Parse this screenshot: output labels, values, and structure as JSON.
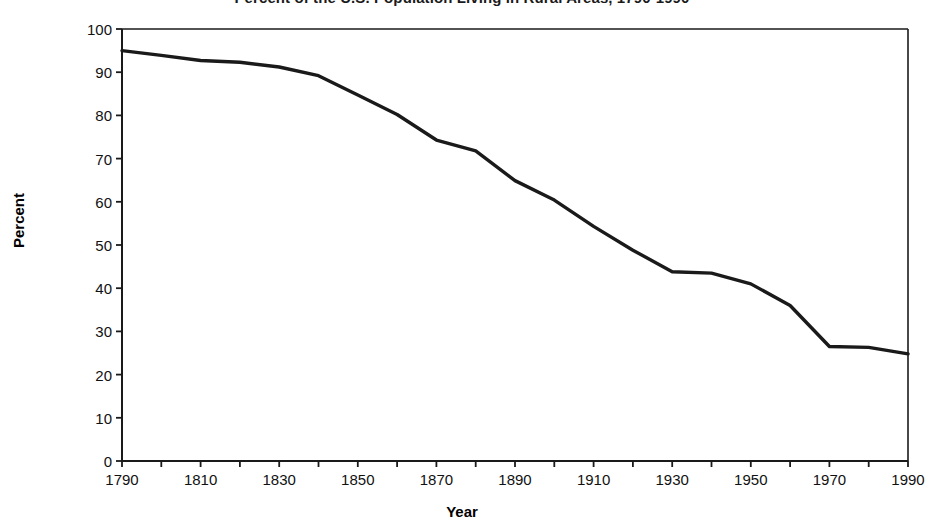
{
  "chart_data": {
    "type": "line",
    "title": "Percent of the U.S. Population Living in Rural Areas, 1790-1990",
    "xlabel": "Year",
    "ylabel": "Percent",
    "xlim": [
      1790,
      1990
    ],
    "ylim": [
      0,
      100
    ],
    "grid": false,
    "legend": null,
    "x_ticks": [
      "1790",
      "1810",
      "1830",
      "1850",
      "1870",
      "1890",
      "1910",
      "1930",
      "1950",
      "1970",
      "1990"
    ],
    "y_ticks": [
      "0",
      "10",
      "20",
      "30",
      "40",
      "50",
      "60",
      "70",
      "80",
      "90",
      "100"
    ],
    "series": [
      {
        "name": "Rural population",
        "color": "#1a1a1a",
        "x": [
          1790,
          1800,
          1810,
          1820,
          1830,
          1840,
          1850,
          1860,
          1870,
          1880,
          1890,
          1900,
          1910,
          1920,
          1930,
          1940,
          1950,
          1960,
          1970,
          1980,
          1990
        ],
        "values": [
          95.0,
          93.9,
          92.7,
          92.3,
          91.2,
          89.2,
          84.7,
          80.2,
          74.3,
          71.8,
          64.9,
          60.4,
          54.3,
          48.8,
          43.8,
          43.5,
          41.0,
          36.0,
          26.5,
          26.3,
          24.8
        ]
      }
    ]
  },
  "axes": {
    "title": "Percent of the U.S. Population Living in Rural Areas, 1790-1990",
    "y_title": "Percent",
    "x_title": "Year"
  }
}
